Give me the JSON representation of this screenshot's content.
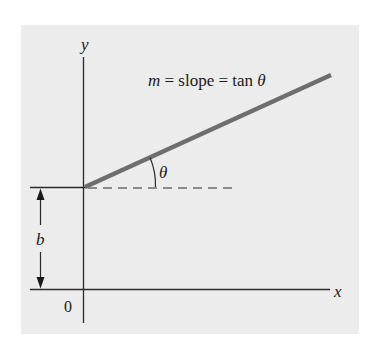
{
  "diagram": {
    "axes": {
      "x_label": "x",
      "y_label": "y",
      "origin_label": "0"
    },
    "equation": {
      "m": "m",
      "eq1": " = slope = tan ",
      "theta": "θ"
    },
    "angle_label": "θ",
    "intercept_label": "b",
    "colors": {
      "background": "#ececec",
      "axis": "#2a2a2a",
      "line": "#6e6e6e"
    }
  }
}
